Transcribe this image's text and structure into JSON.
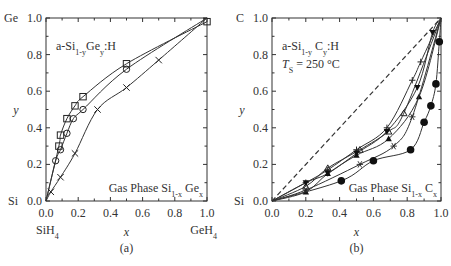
{
  "chart_data": [
    {
      "type": "scatter",
      "panel_label": "(a)",
      "inset_title": "a-Si1-yGey:H",
      "inset_title_parts": {
        "base": "a-Si",
        "sub1": "1-y",
        "mid": "Ge",
        "sub2": "y",
        "end": ":H"
      },
      "annotation": "Gas Phase Si1-x Gex",
      "annotation_parts": {
        "base": "Gas Phase Si",
        "sub1": "1-x",
        "mid": " Ge",
        "sub2": "x"
      },
      "xlabel": "x",
      "ylabel": "y",
      "y_top_label": "Ge",
      "y_bottom_label": "Si",
      "x_left_label": "SiH4",
      "x_right_label": "GeH4",
      "xlim": [
        0,
        1.0
      ],
      "ylim": [
        0,
        1.0
      ],
      "xticks": [
        "0.0",
        "0.2",
        "0.4",
        "0.6",
        "0.8",
        "1.0"
      ],
      "yticks": [
        "0.0",
        "0.2",
        "0.4",
        "0.6",
        "0.8",
        "1.0"
      ],
      "grid": false,
      "series": [
        {
          "name": "squares",
          "marker": "square",
          "x": [
            0.08,
            0.09,
            0.13,
            0.18,
            0.23,
            0.5,
            1.0
          ],
          "y": [
            0.3,
            0.36,
            0.45,
            0.52,
            0.57,
            0.75,
            0.98
          ]
        },
        {
          "name": "circles",
          "marker": "circle-open",
          "x": [
            0.06,
            0.09,
            0.13,
            0.17,
            0.23,
            0.5
          ],
          "y": [
            0.22,
            0.28,
            0.37,
            0.45,
            0.5,
            0.72
          ]
        },
        {
          "name": "crosses",
          "marker": "x",
          "x": [
            0.03,
            0.09,
            0.18,
            0.32,
            0.5,
            0.7
          ],
          "y": [
            0.05,
            0.13,
            0.26,
            0.5,
            0.62,
            0.77
          ]
        }
      ]
    },
    {
      "type": "scatter",
      "panel_label": "(b)",
      "inset_title": "a-Si1-yCy:H",
      "inset_title_parts": {
        "base": "a-Si",
        "sub1": "1-y",
        "mid": " C",
        "sub2": "y",
        "end": ":H"
      },
      "inset_subtitle": "Ts = 250 °C",
      "inset_subtitle_parts": {
        "t": "T",
        "sub": "S",
        "rest": " = 250 °C"
      },
      "annotation": "Gas Phase Si1-x Cx",
      "annotation_parts": {
        "base": "Gas Phase Si",
        "sub1": "1-x",
        "mid": " C",
        "sub2": "x"
      },
      "xlabel": "x",
      "ylabel": "y",
      "y_top_label": "C",
      "y_bottom_label": "Si",
      "xlim": [
        0,
        1.0
      ],
      "ylim": [
        0,
        1.0
      ],
      "xticks": [
        "0.0",
        "0.2",
        "0.4",
        "0.6",
        "0.8",
        "1.0"
      ],
      "yticks": [
        "0.0",
        "0.2",
        "0.4",
        "0.6",
        "0.8",
        "1.0"
      ],
      "grid": false,
      "reference_line": "y = x (dashed)",
      "series": [
        {
          "name": "plus",
          "marker": "plus",
          "x": [
            0.2,
            0.33,
            0.5,
            0.68,
            0.83,
            0.88
          ],
          "y": [
            0.1,
            0.17,
            0.28,
            0.4,
            0.66,
            0.76
          ]
        },
        {
          "name": "open-triangles-up",
          "marker": "triangle-up-open",
          "x": [
            0.2,
            0.33,
            0.52,
            0.69,
            0.78
          ],
          "y": [
            0.08,
            0.18,
            0.28,
            0.38,
            0.48
          ]
        },
        {
          "name": "down-triangles",
          "marker": "triangle-down",
          "x": [
            0.2,
            0.33,
            0.5,
            0.68,
            0.86,
            0.95
          ],
          "y": [
            0.1,
            0.15,
            0.26,
            0.38,
            0.62,
            0.92
          ]
        },
        {
          "name": "filled-triangles-up",
          "marker": "triangle-up",
          "x": [
            0.2,
            0.33,
            0.5,
            0.69,
            0.87
          ],
          "y": [
            0.05,
            0.15,
            0.25,
            0.34,
            0.57
          ]
        },
        {
          "name": "stars",
          "marker": "asterisk",
          "x": [
            0.2,
            0.52,
            0.72,
            0.83
          ],
          "y": [
            0.06,
            0.2,
            0.3,
            0.46
          ]
        },
        {
          "name": "filled-circles",
          "marker": "circle",
          "x": [
            0.41,
            0.6,
            0.82,
            0.9,
            0.94,
            0.97,
            0.99
          ],
          "y": [
            0.11,
            0.22,
            0.28,
            0.43,
            0.52,
            0.64,
            0.87
          ]
        }
      ]
    }
  ]
}
